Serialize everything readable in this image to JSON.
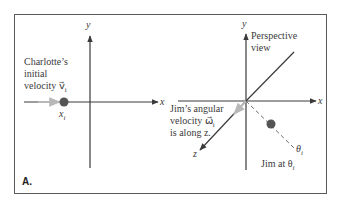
{
  "figure": {
    "panel_label": "A.",
    "left_panel": {
      "axis_x": "x",
      "axis_y": "y",
      "caption_line1": "Charlotte’s",
      "caption_line2": "initial",
      "caption_line3": "velocity v⃗",
      "caption_sub": "i",
      "position_label": "x",
      "position_sub": "i"
    },
    "right_panel": {
      "axis_x": "x",
      "axis_y": "y",
      "axis_z": "z",
      "perspective_line1": "Perspective",
      "perspective_line2": "view",
      "omega_line1": "Jim’s angular",
      "omega_line2": "velocity ω⃗",
      "omega_sub": "i",
      "omega_line3": "is along z.",
      "theta_label": "θ",
      "theta_sub": "i",
      "jim_label": "Jim at θ",
      "jim_sub": "i"
    },
    "colors": {
      "axis": "#3a3a3a",
      "dot": "#555555",
      "arrow_gray": "#b8b8b8",
      "dashed": "#6a6a6a"
    }
  }
}
